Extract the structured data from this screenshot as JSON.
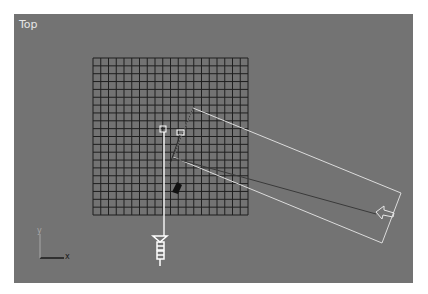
{
  "viewport": {
    "label": "Top",
    "background": "#737373",
    "axis": {
      "x_label": "x",
      "y_label": "y"
    }
  },
  "scene": {
    "grid": {
      "cells_x": 20,
      "cells_y": 20,
      "color": "#1f1f1f"
    },
    "objects": [
      {
        "name": "grid-plane",
        "type": "grid"
      },
      {
        "name": "plane-rectangle",
        "type": "rectangle-outline"
      },
      {
        "name": "light-target",
        "type": "box-marker"
      },
      {
        "name": "camera-target",
        "type": "box-marker"
      },
      {
        "name": "camera",
        "type": "camera-icon"
      },
      {
        "name": "direction-arrow",
        "type": "arrow"
      },
      {
        "name": "dark-arrow",
        "type": "arrow"
      }
    ]
  }
}
